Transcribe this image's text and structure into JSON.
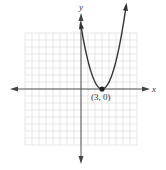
{
  "chart_data": {
    "type": "line",
    "title": "",
    "xlabel": "x",
    "ylabel": "y",
    "xlim": [
      -8,
      8
    ],
    "ylim": [
      -8,
      8
    ],
    "grid": true,
    "function": "y = (x - 3)^2",
    "series": [
      {
        "name": "parabola",
        "x": [
          0,
          1,
          2,
          3,
          4,
          5,
          6
        ],
        "values": [
          9,
          4,
          1,
          0,
          1,
          4,
          9
        ]
      }
    ],
    "annotations": [
      {
        "label": "(3, 0)",
        "x": 3,
        "y": 0,
        "marker": "filled-circle"
      }
    ],
    "axes_arrows": true
  },
  "labels": {
    "x_axis": "x",
    "y_axis": "y",
    "vertex": "(3, 0)"
  },
  "colors": {
    "grid": "#d9d9d9",
    "axis": "#555555",
    "curve": "#333333",
    "point": "#222222"
  }
}
